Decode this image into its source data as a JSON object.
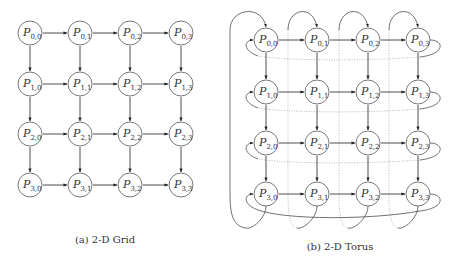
{
  "figure": {
    "grid": {
      "caption": "(a) 2-D Grid",
      "rows": 4,
      "cols": 4,
      "label_prefix": "P",
      "nodes": [
        [
          "0,0",
          "0,1",
          "0,2",
          "0,3"
        ],
        [
          "1,0",
          "1,1",
          "1,2",
          "1,3"
        ],
        [
          "2,0",
          "2,1",
          "2,2",
          "2,3"
        ],
        [
          "3,0",
          "3,1",
          "3,2",
          "3,3"
        ]
      ]
    },
    "torus": {
      "caption": "(b) 2-D Torus",
      "rows": 4,
      "cols": 4,
      "label_prefix": "P",
      "nodes": [
        [
          "0,0",
          "0,1",
          "0,2",
          "0,3"
        ],
        [
          "1,0",
          "1,1",
          "1,2",
          "1,3"
        ],
        [
          "2,0",
          "2,1",
          "2,2",
          "2,3"
        ],
        [
          "3,0",
          "3,1",
          "3,2",
          "3,3"
        ]
      ]
    }
  }
}
